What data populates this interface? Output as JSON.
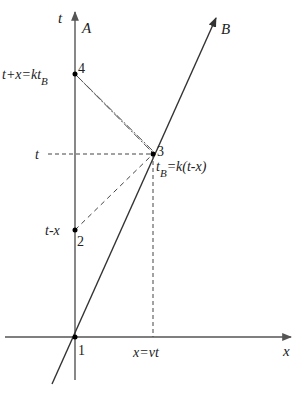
{
  "diagram": {
    "axes": {
      "t_axis_label": "t",
      "x_axis_label": "x",
      "worldline_A_label": "A",
      "worldline_B_label": "B"
    },
    "points": [
      {
        "id": "1",
        "label": "1",
        "annotation": ""
      },
      {
        "id": "2",
        "label": "2",
        "annotation": "t-x"
      },
      {
        "id": "3",
        "label": "3",
        "annotation": "t_B=k(t-x)",
        "annotation_main": "t",
        "annotation_sub": "B",
        "annotation_rest": "=k(t-x)"
      },
      {
        "id": "4",
        "label": "4",
        "annotation": "t+x=kt_B",
        "annotation_main": "t+x=kt",
        "annotation_sub": "B"
      }
    ],
    "guide_labels": {
      "t_level": "t",
      "x_position": "x=vt"
    },
    "lines": [
      {
        "name": "signal 2→3",
        "style": "dashed"
      },
      {
        "name": "signal 3→4",
        "style": "dash-dot double"
      },
      {
        "name": "projection of 3 to t-axis",
        "style": "dashed"
      },
      {
        "name": "projection of 3 to x-axis",
        "style": "dashed"
      }
    ],
    "colors": {
      "axis": "#555555",
      "worldline_B": "#333333",
      "dashed": "#444444",
      "point": "#000000"
    }
  }
}
